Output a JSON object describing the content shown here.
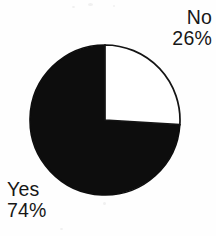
{
  "chart_data": {
    "type": "pie",
    "title": "",
    "subtitle": "",
    "xlabel": "",
    "ylabel": "",
    "legend_position": "none",
    "grid": false,
    "labels_inline": true,
    "start_angle_deg": 0,
    "direction": "clockwise",
    "categories": [
      "No",
      "Yes"
    ],
    "values": [
      26,
      74
    ],
    "unit": "%",
    "slices": [
      {
        "name": "No",
        "value": 26,
        "value_label": "26%",
        "color": "#ffffff",
        "stroke": "#141414",
        "label_position": "outside-top-right"
      },
      {
        "name": "Yes",
        "value": 74,
        "value_label": "74%",
        "color": "#0d0d0d",
        "stroke": "#0d0d0d",
        "label_position": "outside-bottom-left"
      }
    ]
  },
  "labels": {
    "no": {
      "name": "No",
      "value": "26%"
    },
    "yes": {
      "name": "Yes",
      "value": "74%"
    }
  },
  "colors": {
    "background": "#fefefe",
    "slice_yes": "#0d0d0d",
    "slice_no": "#ffffff",
    "outline": "#141414",
    "text": "#171717"
  }
}
